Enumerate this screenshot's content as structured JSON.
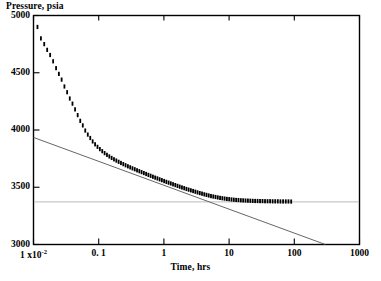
{
  "chart_data": {
    "type": "scatter",
    "title": "",
    "xlabel": "Time, hrs",
    "ylabel": "Pressure, psia",
    "xscale": "log",
    "yscale": "linear",
    "xlim": [
      0.01,
      1000
    ],
    "ylim": [
      3000,
      5000
    ],
    "grid": false,
    "legend": null,
    "xticks": [
      0.01,
      0.1,
      1,
      10,
      100,
      1000
    ],
    "xtick_labels": [
      "1 x10 -2",
      "0. 1",
      "1",
      "10",
      "100",
      "1000"
    ],
    "yticks": [
      3000,
      3500,
      4000,
      4500,
      5000
    ],
    "ytick_labels": [
      "3000",
      "3500",
      "4000",
      "4500",
      "5000"
    ],
    "series": [
      {
        "name": "pressure-data",
        "marker": "vertical-tick",
        "color": "#000000",
        "x": [
          0.0115,
          0.013,
          0.0146,
          0.0162,
          0.018,
          0.02,
          0.0222,
          0.0245,
          0.027,
          0.0298,
          0.0328,
          0.036,
          0.0396,
          0.0434,
          0.0476,
          0.0521,
          0.057,
          0.0622,
          0.068,
          0.0742,
          0.0808,
          0.088,
          0.0958,
          0.1042,
          0.1133,
          0.1232,
          0.1339,
          0.1455,
          0.158,
          0.1716,
          0.1863,
          0.2022,
          0.2195,
          0.2382,
          0.2584,
          0.2803,
          0.304,
          0.3296,
          0.3573,
          0.3873,
          0.4197,
          0.4548,
          0.4928,
          0.5338,
          0.5782,
          0.6262,
          0.6781,
          0.7342,
          0.7948,
          0.8603,
          0.9311,
          1.0077,
          1.0905,
          1.18,
          1.2768,
          1.3814,
          1.4945,
          1.6168,
          1.7491,
          1.8921,
          2.0468,
          2.2142,
          2.3953,
          2.5913,
          2.8034,
          3.033,
          3.2816,
          3.5509,
          3.8427,
          4.1588,
          4.5014,
          4.873,
          5.276,
          5.7133,
          6.188,
          6.7035,
          7.2634,
          7.8718,
          8.5329,
          9.2516,
          10.033,
          10.883,
          11.809,
          12.818,
          13.919,
          15.12,
          16.431,
          17.864,
          19.431,
          21.146,
          23.025,
          25.085,
          27.345,
          29.827,
          32.555,
          35.557,
          38.861,
          42.503,
          46.52,
          50.955,
          55.856,
          61.279,
          67.285,
          73.946,
          81.343,
          89.568
        ],
        "y": [
          4900,
          4800,
          4750,
          4700,
          4655,
          4600,
          4540,
          4490,
          4440,
          4380,
          4330,
          4275,
          4230,
          4180,
          4130,
          4080,
          4040,
          3995,
          3960,
          3930,
          3900,
          3875,
          3853,
          3833,
          3815,
          3798,
          3783,
          3769,
          3756,
          3744,
          3733,
          3722,
          3712,
          3702,
          3692,
          3683,
          3674,
          3665,
          3657,
          3648,
          3640,
          3632,
          3624,
          3616,
          3608,
          3600,
          3592,
          3584,
          3577,
          3569,
          3562,
          3554,
          3547,
          3540,
          3533,
          3526,
          3519,
          3512,
          3505,
          3498,
          3492,
          3485,
          3479,
          3473,
          3467,
          3461,
          3455,
          3449,
          3444,
          3438,
          3433,
          3428,
          3423,
          3419,
          3415,
          3411,
          3407,
          3404,
          3401,
          3398,
          3396,
          3393,
          3391,
          3389,
          3388,
          3386,
          3385,
          3384,
          3383,
          3382,
          3381,
          3380,
          3380,
          3379,
          3379,
          3378,
          3378,
          3378,
          3377,
          3377,
          3377,
          3376,
          3376,
          3376,
          3376,
          3375
        ]
      }
    ],
    "reference_lines": [
      {
        "name": "semilog-straight-line",
        "type": "line",
        "orientation": "sloped",
        "color": "#555555",
        "points": [
          [
            0.01,
            3935
          ],
          [
            300,
            3000
          ]
        ]
      },
      {
        "name": "horizontal-asymptote",
        "type": "line",
        "orientation": "horizontal",
        "color": "#bbbbbb",
        "y": 3372
      }
    ]
  },
  "axes": {
    "ylabel_title": "Pressure, psia",
    "xlabel_title": "Time, hrs",
    "y_ticks": [
      {
        "label": "5000",
        "value": 5000
      },
      {
        "label": "4500",
        "value": 4500
      },
      {
        "label": "4000",
        "value": 4000
      },
      {
        "label": "3500",
        "value": 3500
      },
      {
        "label": "3000",
        "value": 3000
      }
    ],
    "x_ticks": [
      {
        "label": "1 x10",
        "sup": "-2",
        "value": 0.01
      },
      {
        "label": "0. 1",
        "sup": "",
        "value": 0.1
      },
      {
        "label": "1",
        "sup": "",
        "value": 1
      },
      {
        "label": "10",
        "sup": "",
        "value": 10
      },
      {
        "label": "100",
        "sup": "",
        "value": 100
      },
      {
        "label": "1000",
        "sup": "",
        "value": 1000
      }
    ]
  },
  "colors": {
    "frame": "#000000",
    "data": "#000000",
    "fit_line": "#555555",
    "asymptote": "#bdbdbd",
    "background": "#ffffff"
  }
}
